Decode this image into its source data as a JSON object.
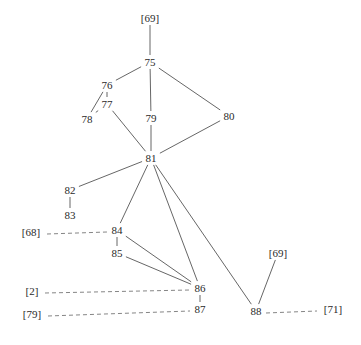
{
  "diagram": {
    "type": "stemma",
    "nodes": [
      {
        "id": "r69top",
        "label": "[69]"
      },
      {
        "id": "n75",
        "label": "75"
      },
      {
        "id": "n76",
        "label": "76"
      },
      {
        "id": "n77",
        "label": "77"
      },
      {
        "id": "n78",
        "label": "78"
      },
      {
        "id": "n79",
        "label": "79"
      },
      {
        "id": "n80",
        "label": "80"
      },
      {
        "id": "n81",
        "label": "81"
      },
      {
        "id": "n82",
        "label": "82"
      },
      {
        "id": "n83",
        "label": "83"
      },
      {
        "id": "r68",
        "label": "[68]"
      },
      {
        "id": "n84",
        "label": "84"
      },
      {
        "id": "n85",
        "label": "85"
      },
      {
        "id": "n86",
        "label": "86"
      },
      {
        "id": "r2",
        "label": "[2]"
      },
      {
        "id": "n87",
        "label": "87"
      },
      {
        "id": "r79",
        "label": "[79]"
      },
      {
        "id": "r69right",
        "label": "[69]"
      },
      {
        "id": "n88",
        "label": "88"
      },
      {
        "id": "r71",
        "label": "[71]"
      }
    ],
    "edges": [
      {
        "from": "r69top",
        "to": "n75",
        "style": "solid"
      },
      {
        "from": "n75",
        "to": "n76",
        "style": "solid"
      },
      {
        "from": "n75",
        "to": "n79",
        "style": "solid"
      },
      {
        "from": "n75",
        "to": "n80",
        "style": "solid"
      },
      {
        "from": "n76",
        "to": "n77",
        "style": "solid"
      },
      {
        "from": "n76",
        "to": "n78",
        "style": "solid"
      },
      {
        "from": "n77",
        "to": "n78",
        "style": "solid"
      },
      {
        "from": "n77",
        "to": "n81",
        "style": "solid"
      },
      {
        "from": "n79",
        "to": "n81",
        "style": "solid"
      },
      {
        "from": "n80",
        "to": "n81",
        "style": "solid"
      },
      {
        "from": "n81",
        "to": "n82",
        "style": "solid"
      },
      {
        "from": "n82",
        "to": "n83",
        "style": "solid"
      },
      {
        "from": "n81",
        "to": "n84",
        "style": "solid"
      },
      {
        "from": "n81",
        "to": "n86",
        "style": "solid"
      },
      {
        "from": "n81",
        "to": "n88",
        "style": "solid"
      },
      {
        "from": "n84",
        "to": "n85",
        "style": "solid"
      },
      {
        "from": "n84",
        "to": "n86",
        "style": "solid"
      },
      {
        "from": "n85",
        "to": "n86",
        "style": "solid"
      },
      {
        "from": "n86",
        "to": "n87",
        "style": "solid"
      },
      {
        "from": "r69right",
        "to": "n88",
        "style": "solid"
      },
      {
        "from": "r68",
        "to": "n84",
        "style": "dashed"
      },
      {
        "from": "r2",
        "to": "n86",
        "style": "dashed"
      },
      {
        "from": "r79",
        "to": "n87",
        "style": "dashed"
      },
      {
        "from": "n88",
        "to": "r71",
        "style": "dashed"
      }
    ]
  }
}
